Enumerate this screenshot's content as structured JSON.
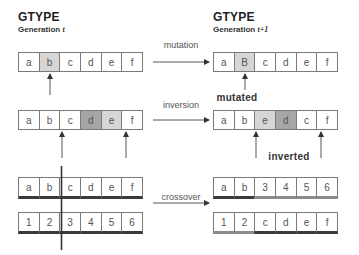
{
  "left_header": {
    "title": "GTYPE",
    "subtitle_prefix": "Generation ",
    "subtitle_var": "t"
  },
  "right_header": {
    "title": "GTYPE",
    "subtitle_prefix": "Generation ",
    "subtitle_var": "t+1"
  },
  "mutation": {
    "operation_label": "mutation",
    "before": [
      "a",
      "b",
      "c",
      "d",
      "e",
      "f"
    ],
    "after": [
      "a",
      "B",
      "c",
      "d",
      "e",
      "f"
    ],
    "highlight_index": 1,
    "result_label": "mutated"
  },
  "inversion": {
    "operation_label": "inversion",
    "before": [
      "a",
      "b",
      "c",
      "d",
      "e",
      "f"
    ],
    "after": [
      "a",
      "b",
      "e",
      "d",
      "c",
      "f"
    ],
    "result_label": "inverted"
  },
  "crossover": {
    "operation_label": "crossover",
    "parent1": [
      "a",
      "b",
      "c",
      "d",
      "e",
      "f"
    ],
    "parent2": [
      "1",
      "2",
      "3",
      "4",
      "5",
      "6"
    ],
    "child1": [
      "a",
      "b",
      "3",
      "4",
      "5",
      "6"
    ],
    "child2": [
      "1",
      "2",
      "c",
      "d",
      "e",
      "f"
    ],
    "cut_point": 2
  },
  "colors": {
    "line": "#555555",
    "cell_border": "#7a7a7a",
    "light_fill": "#d6d6d6",
    "dark_fill": "#a6a6a6",
    "underline_dark": "#3a3a3a",
    "underline_light": "#8c8c8c"
  }
}
